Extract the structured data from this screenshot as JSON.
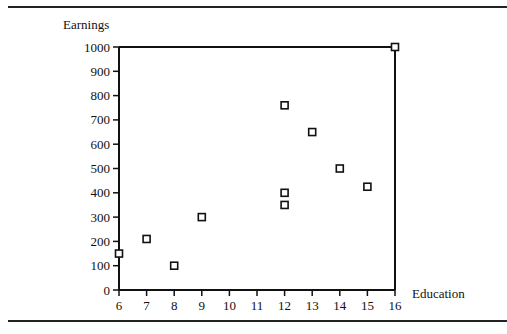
{
  "chart_data": {
    "type": "scatter",
    "title": "",
    "xlabel": "Education",
    "ylabel": "Earnings",
    "xlim": [
      6,
      16
    ],
    "ylim": [
      0,
      1000
    ],
    "grid": false,
    "legend": null,
    "x_ticks": [
      6,
      7,
      8,
      9,
      10,
      11,
      12,
      13,
      14,
      15,
      16
    ],
    "y_ticks": [
      0,
      100,
      200,
      300,
      400,
      500,
      600,
      700,
      800,
      900,
      1000
    ],
    "marker": "hollow-square",
    "points": [
      {
        "x": 6,
        "y": 150
      },
      {
        "x": 7,
        "y": 210
      },
      {
        "x": 8,
        "y": 100
      },
      {
        "x": 9,
        "y": 300
      },
      {
        "x": 12,
        "y": 760
      },
      {
        "x": 12,
        "y": 400
      },
      {
        "x": 12,
        "y": 350
      },
      {
        "x": 13,
        "y": 650
      },
      {
        "x": 14,
        "y": 500
      },
      {
        "x": 15,
        "y": 425
      },
      {
        "x": 16,
        "y": 1000
      }
    ]
  },
  "labels": {
    "ylabel": "Earnings",
    "xlabel": "Education"
  }
}
